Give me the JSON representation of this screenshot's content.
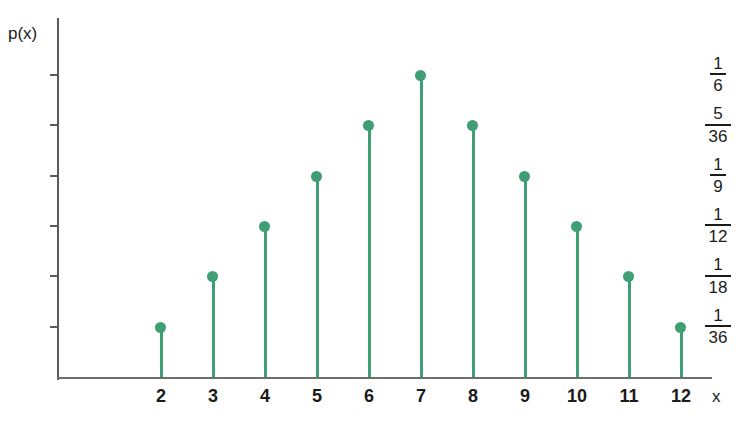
{
  "chart_data": {
    "type": "scatter",
    "title": "",
    "subtitle": "",
    "xlabel": "x",
    "ylabel": "p(x)",
    "grid": false,
    "legend": null,
    "annotations": [],
    "xlim": [
      1.5,
      12.6
    ],
    "ylim": [
      0,
      0.1806
    ],
    "categories": [
      "2",
      "3",
      "4",
      "5",
      "6",
      "7",
      "8",
      "9",
      "10",
      "11",
      "12"
    ],
    "x": [
      2,
      3,
      4,
      5,
      6,
      7,
      8,
      9,
      10,
      11,
      12
    ],
    "values": [
      0.027777777,
      0.055555555,
      0.083333333,
      0.111111111,
      0.138888888,
      0.166666666,
      0.138888888,
      0.111111111,
      0.083333333,
      0.055555555,
      0.027777777
    ],
    "value_labels": [
      "1/36",
      "1/18",
      "1/12",
      "1/9",
      "5/36",
      "1/6",
      "5/36",
      "1/9",
      "1/12",
      "1/18",
      "1/36"
    ],
    "point_color": "#3f9e74",
    "stem_color": "#3f9e74",
    "axis_color": "#5a5a5a",
    "text_color": "#1b1b1b",
    "ytick_labels": [
      {
        "num": "1",
        "den": "6",
        "value": 0.166666666
      },
      {
        "num": "5",
        "den": "36",
        "value": 0.138888888
      },
      {
        "num": "1",
        "den": "9",
        "value": 0.111111111
      },
      {
        "num": "1",
        "den": "12",
        "value": 0.083333333
      },
      {
        "num": "1",
        "den": "18",
        "value": 0.055555555
      },
      {
        "num": "1",
        "den": "36",
        "value": 0.027777777
      }
    ],
    "xtick_labels": [
      "2",
      "3",
      "4",
      "5",
      "6",
      "7",
      "8",
      "9",
      "10",
      "11",
      "12"
    ]
  }
}
